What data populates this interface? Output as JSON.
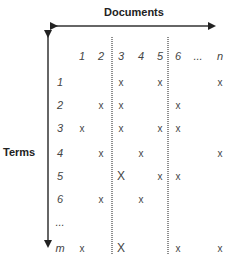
{
  "axes": {
    "horizontal_label": "Documents",
    "vertical_label": "Terms"
  },
  "columns": [
    {
      "label": "1",
      "x": 82
    },
    {
      "label": "2",
      "x": 101
    },
    {
      "label": "3",
      "x": 121
    },
    {
      "label": "4",
      "x": 141
    },
    {
      "label": "5",
      "x": 160
    },
    {
      "label": "6",
      "x": 178
    },
    {
      "label": "...",
      "x": 198
    },
    {
      "label": "n",
      "x": 220
    }
  ],
  "rows": [
    {
      "label": "1",
      "y": 82,
      "marks": [
        {
          "col": 2,
          "m": "x"
        },
        {
          "col": 4,
          "m": "x"
        },
        {
          "col": 7,
          "m": "x"
        }
      ]
    },
    {
      "label": "2",
      "y": 105,
      "marks": [
        {
          "col": 1,
          "m": "x"
        },
        {
          "col": 2,
          "m": "x"
        },
        {
          "col": 5,
          "m": "x"
        }
      ]
    },
    {
      "label": "3",
      "y": 128,
      "marks": [
        {
          "col": 0,
          "m": "x"
        },
        {
          "col": 2,
          "m": "x"
        },
        {
          "col": 4,
          "m": "x"
        },
        {
          "col": 5,
          "m": "x"
        }
      ]
    },
    {
      "label": "4",
      "y": 153,
      "marks": [
        {
          "col": 1,
          "m": "x"
        },
        {
          "col": 3,
          "m": "x"
        },
        {
          "col": 7,
          "m": "x"
        }
      ]
    },
    {
      "label": "5",
      "y": 176,
      "marks": [
        {
          "col": 2,
          "m": "X"
        },
        {
          "col": 4,
          "m": "x"
        },
        {
          "col": 5,
          "m": "x"
        }
      ]
    },
    {
      "label": "6",
      "y": 199,
      "marks": [
        {
          "col": 1,
          "m": "x"
        },
        {
          "col": 3,
          "m": "x"
        }
      ]
    },
    {
      "label": "...",
      "y": 222,
      "marks": []
    },
    {
      "label": "m",
      "y": 248,
      "marks": [
        {
          "col": 0,
          "m": "x"
        },
        {
          "col": 2,
          "m": "X"
        },
        {
          "col": 5,
          "m": "x"
        },
        {
          "col": 7,
          "m": "x"
        }
      ]
    }
  ],
  "header_row_y": 56,
  "row_label_x": 60,
  "dotted_lines_x": [
    112,
    168
  ],
  "colors": {
    "line": "#333333",
    "dotted": "#444444",
    "text": "#444444"
  }
}
